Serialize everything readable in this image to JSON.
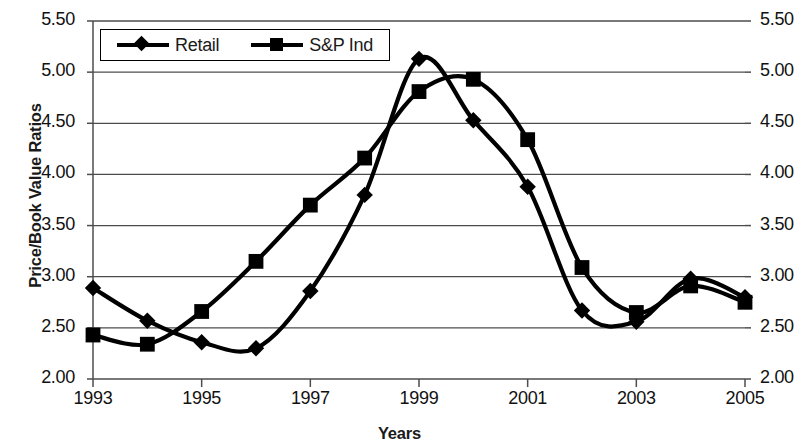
{
  "chart_data": {
    "type": "line",
    "title": "",
    "xlabel": "Years",
    "ylabel": "Price/Book Value Ratios",
    "x": [
      1993,
      1994,
      1995,
      1996,
      1997,
      1998,
      1999,
      2000,
      2001,
      2002,
      2003,
      2004,
      2005
    ],
    "xlim": [
      1993,
      2005
    ],
    "ylim": [
      2.0,
      5.5
    ],
    "ytick_values": [
      2.0,
      2.5,
      3.0,
      3.5,
      4.0,
      4.5,
      5.0,
      5.5
    ],
    "ytick_labels": [
      "2.00",
      "2.50",
      "3.00",
      "3.50",
      "4.00",
      "4.50",
      "5.00",
      "5.50"
    ],
    "ytick_labels_right": [
      "2.00",
      "2.50",
      "3.00",
      "3.50",
      "4.00",
      "4.50",
      "5.00",
      "5.50"
    ],
    "xtick_values": [
      1993,
      1995,
      1997,
      1999,
      2001,
      2003,
      2005
    ],
    "xtick_labels": [
      "1993",
      "1995",
      "1997",
      "1999",
      "2001",
      "2003",
      "2005"
    ],
    "grid": "horizontal",
    "legend_position": "top-left-inside",
    "series": [
      {
        "name": "Retail",
        "marker": "diamond",
        "color": "#000000",
        "values": [
          2.89,
          2.57,
          2.36,
          2.3,
          2.86,
          3.8,
          5.13,
          4.53,
          3.88,
          2.67,
          2.56,
          2.98,
          2.8
        ]
      },
      {
        "name": "S&P Ind",
        "marker": "square",
        "color": "#000000",
        "values": [
          2.43,
          2.34,
          2.66,
          3.15,
          3.7,
          4.16,
          4.81,
          4.93,
          4.34,
          3.09,
          2.65,
          2.91,
          2.75
        ]
      }
    ]
  },
  "legend": {
    "items": [
      {
        "label": "Retail",
        "marker": "diamond"
      },
      {
        "label": "S&P Ind",
        "marker": "square"
      }
    ]
  },
  "axes": {
    "y_title": "Price/Book Value Ratios",
    "x_title": "Years"
  }
}
